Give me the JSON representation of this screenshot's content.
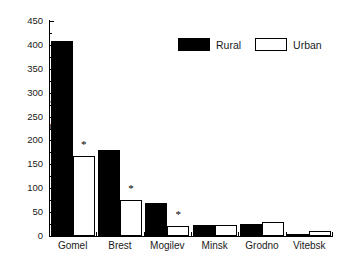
{
  "chart_data": {
    "type": "bar",
    "title": "",
    "subtitle": "",
    "xlabel": "",
    "ylabel": "Prevalence",
    "categories": [
      "Gomel",
      "Brest",
      "Mogilev",
      "Minsk",
      "Grodno",
      "Vitebsk"
    ],
    "series": [
      {
        "name": "Rural",
        "color": "#000000",
        "fill": "solid",
        "values": [
          408,
          180,
          69,
          23,
          26,
          5
        ]
      },
      {
        "name": "Urban",
        "color": "#ffffff",
        "fill": "open",
        "values": [
          167,
          75,
          20,
          23,
          30,
          11
        ]
      }
    ],
    "annotations": [
      {
        "text": "*",
        "category": "Gomel",
        "series": "Urban",
        "value": 167
      },
      {
        "text": "*",
        "category": "Brest",
        "series": "Urban",
        "value": 75
      },
      {
        "text": "*",
        "category": "Mogilev",
        "series": "Urban",
        "value": 20
      }
    ],
    "ylim": [
      0,
      450
    ],
    "ytick_labels": [
      "0",
      "50",
      "100",
      "150",
      "200",
      "250",
      "300",
      "350",
      "400",
      "450"
    ],
    "ytick_values": [
      0,
      50,
      100,
      150,
      200,
      250,
      300,
      350,
      400,
      450
    ],
    "ytick_interval": 50,
    "grid": false,
    "legend_position": "top-right",
    "frame": "left-bottom-only"
  },
  "legend": {
    "items": [
      {
        "label": "Rural",
        "swatch": "filled-black-rect"
      },
      {
        "label": "Urban",
        "swatch": "open-white-rect"
      }
    ]
  },
  "axes": {
    "y_label": "Prevalence"
  }
}
